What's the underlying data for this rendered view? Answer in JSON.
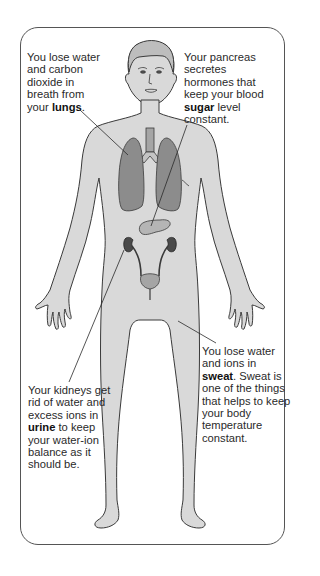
{
  "diagram": {
    "colors": {
      "skin": "#d9d9d9",
      "outline": "#3a3a3a",
      "organ": "#8c8c8c",
      "kidney": "#4a4a4a",
      "frame": "#555555"
    },
    "annotations": [
      {
        "id": "lungs",
        "pre": "You lose water and carbon dioxide in breath from your ",
        "bold": "lungs",
        "post": ".",
        "target": "lungs"
      },
      {
        "id": "pancreas",
        "pre": "Your pancreas secretes hormones that keep your blood ",
        "bold": "sugar",
        "post": " level constant.",
        "target": "pancreas"
      },
      {
        "id": "kidneys",
        "pre": "Your kidneys get rid of water and excess ions in ",
        "bold": "urine",
        "post": " to keep your water-ion balance as it should be.",
        "target": "kidneys"
      },
      {
        "id": "sweat",
        "pre": "You lose water and ions in ",
        "bold": "sweat",
        "post": ". Sweat is one of the things that helps to keep your body temperature constant.",
        "target": "skin"
      }
    ],
    "organs": [
      "lungs",
      "trachea",
      "pancreas",
      "kidneys",
      "ureters",
      "bladder"
    ]
  }
}
